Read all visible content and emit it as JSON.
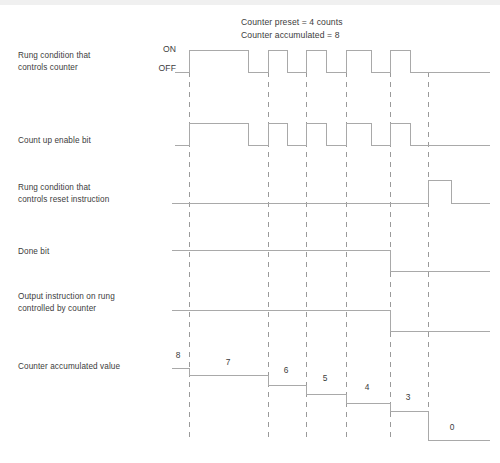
{
  "figure": {
    "type": "timing-diagram",
    "title_note": {
      "line1": "Counter preset = 4 counts",
      "line2": "Counter accumulated = 8"
    },
    "axis_labels": {
      "on": "ON",
      "off": "OFF"
    },
    "rows": [
      {
        "id": "rung-controls-counter",
        "label": "Rung condition that\ncontrols counter",
        "signal": "pulse-train",
        "description": "Five ON pulses; first pulse is wide, remaining four are narrow"
      },
      {
        "id": "count-up-enable-bit",
        "label": "Count up enable bit",
        "signal": "pulse-train",
        "description": "Mirrors the rung condition that controls the counter"
      },
      {
        "id": "rung-controls-reset",
        "label": "Rung condition that\ncontrols reset instruction",
        "signal": "single-late-pulse",
        "description": "Stays OFF until a single pulse after the sixth transition line"
      },
      {
        "id": "done-bit",
        "label": "Done bit",
        "signal": "high-then-low",
        "description": "High until the fifth transition line, then low"
      },
      {
        "id": "output-instruction",
        "label": "Output instruction on rung\ncontrolled by counter",
        "signal": "high-then-low",
        "description": "High until the fifth transition line, then low"
      },
      {
        "id": "counter-accumulated-value",
        "label": "Counter accumulated value",
        "signal": "descending-staircase",
        "description": "Step values decreasing from 8 down to 0"
      }
    ],
    "accumulated_steps": [
      {
        "value": "8",
        "x": 178,
        "y": 356
      },
      {
        "value": "7",
        "x": 228,
        "y": 363
      },
      {
        "value": "6",
        "x": 286,
        "y": 371
      },
      {
        "value": "5",
        "x": 325,
        "y": 378
      },
      {
        "value": "4",
        "x": 367,
        "y": 387
      },
      {
        "value": "3",
        "x": 408,
        "y": 398
      },
      {
        "value": "0",
        "x": 452,
        "y": 428
      }
    ],
    "colors": {
      "waveform": "#a9a9a9",
      "dashed_guide": "#9a9a9a",
      "text": "#3c3c3c",
      "background": "#ffffff"
    }
  }
}
